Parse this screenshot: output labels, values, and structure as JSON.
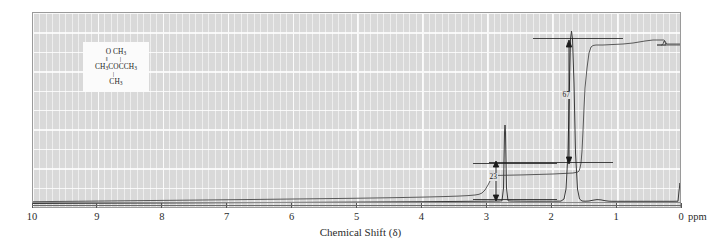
{
  "chart_data": {
    "type": "line",
    "title": "",
    "xlabel": "Chemical Shift (δ)",
    "ylabel": "",
    "xunit": "ppm",
    "xlim": [
      10,
      0
    ],
    "xticks": [
      10,
      9,
      8,
      7,
      6,
      5,
      4,
      3,
      2,
      1,
      0
    ],
    "grid": true,
    "legend": null,
    "series": [
      {
        "name": "1H NMR spectrum",
        "peaks": [
          {
            "shift_ppm": 2.13,
            "relative_height": 0.42,
            "assignment": "CH3CO"
          },
          {
            "shift_ppm": 1.45,
            "relative_height": 1.0,
            "assignment": "C(CH3)2"
          },
          {
            "shift_ppm": 0.0,
            "relative_height": 0.08,
            "assignment": "TMS reference"
          }
        ]
      },
      {
        "name": "integration trace",
        "steps": [
          {
            "shift_ppm": 2.13,
            "height_units": 23
          },
          {
            "shift_ppm": 1.45,
            "height_units": 67
          }
        ]
      }
    ],
    "annotations": [
      {
        "label": "23",
        "x_ppm": 2.35,
        "describes": "integral step height of peak at 2.13 ppm"
      },
      {
        "label": "67",
        "x_ppm": 1.25,
        "describes": "integral step height of peak at 1.45 ppm"
      }
    ]
  },
  "structure": {
    "name": "molecular-structure-inset",
    "line_top": "O   CH",
    "line_top_sub_o": "",
    "line_top_sub": "3",
    "bonds_upper": "‖   |",
    "line_mid_a": "CH",
    "line_mid_sub_a": "3",
    "line_mid_b": "COCCH",
    "line_mid_sub_b": "3",
    "bond_lower": "|",
    "line_bottom": "CH",
    "line_bottom_sub": "3"
  },
  "axis": {
    "label": "Chemical Shift (δ)",
    "unit_label": "ppm",
    "ticks": [
      "10",
      "9",
      "8",
      "7",
      "6",
      "5",
      "4",
      "3",
      "2",
      "1",
      "0"
    ]
  },
  "integrals": {
    "lower_value": "23",
    "upper_value": "67"
  }
}
